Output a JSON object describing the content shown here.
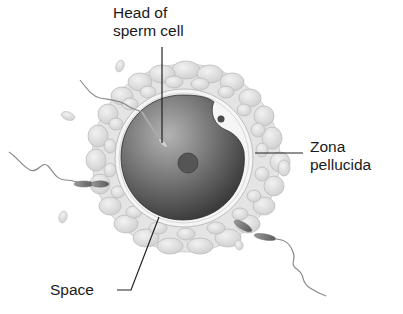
{
  "diagram": {
    "labels": {
      "head": {
        "line1": "Head of",
        "line2": "sperm cell"
      },
      "zona": {
        "line1": "Zona",
        "line2": "pellucida"
      },
      "space": {
        "text": "Space"
      }
    },
    "colors": {
      "background": "#ffffff",
      "corona": "#e2e2e2",
      "zona_ring": "#f4f4f4",
      "ooplasm_dark": "#3a3a3a",
      "ooplasm_light": "#a8a8a8",
      "nucleus": "#555555",
      "leader_line": "#222222",
      "label_text": "#1a1a1a"
    }
  }
}
